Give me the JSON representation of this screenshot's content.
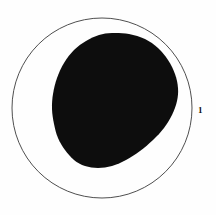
{
  "figure": {
    "background_color": "#fefefe",
    "width": 216,
    "height": 215
  },
  "outer_circle": {
    "name": "outer-boundary-circle",
    "center_x": 102,
    "center_y": 108,
    "radius": 90,
    "stroke_color": "#3b3b3b",
    "stroke_width": 0.9,
    "fill_color": "none"
  },
  "dark_region": {
    "name": "dark-filled-blob",
    "fill_color": "#0d0d0d",
    "description": "egg-shaped dark area, widest toward upper-right, tapering toward lower-left",
    "bounds": {
      "x_min": 52,
      "x_max": 178,
      "y_min": 33,
      "y_max": 168
    },
    "outline_points": [
      [
        112,
        33
      ],
      [
        129,
        34
      ],
      [
        145,
        39
      ],
      [
        158,
        48
      ],
      [
        168,
        60
      ],
      [
        175,
        74
      ],
      [
        178,
        88
      ],
      [
        177,
        101
      ],
      [
        172,
        115
      ],
      [
        164,
        128
      ],
      [
        153,
        140
      ],
      [
        140,
        151
      ],
      [
        126,
        160
      ],
      [
        112,
        166
      ],
      [
        98,
        168
      ],
      [
        85,
        166
      ],
      [
        74,
        160
      ],
      [
        65,
        150
      ],
      [
        58,
        138
      ],
      [
        54,
        124
      ],
      [
        52,
        109
      ],
      [
        53,
        94
      ],
      [
        57,
        78
      ],
      [
        64,
        63
      ],
      [
        74,
        50
      ],
      [
        86,
        41
      ],
      [
        99,
        35
      ]
    ]
  },
  "labels": [
    {
      "id": "label-1",
      "name": "callout-label-1",
      "text": "1",
      "x": 198,
      "y": 106,
      "color": "#111111"
    }
  ]
}
